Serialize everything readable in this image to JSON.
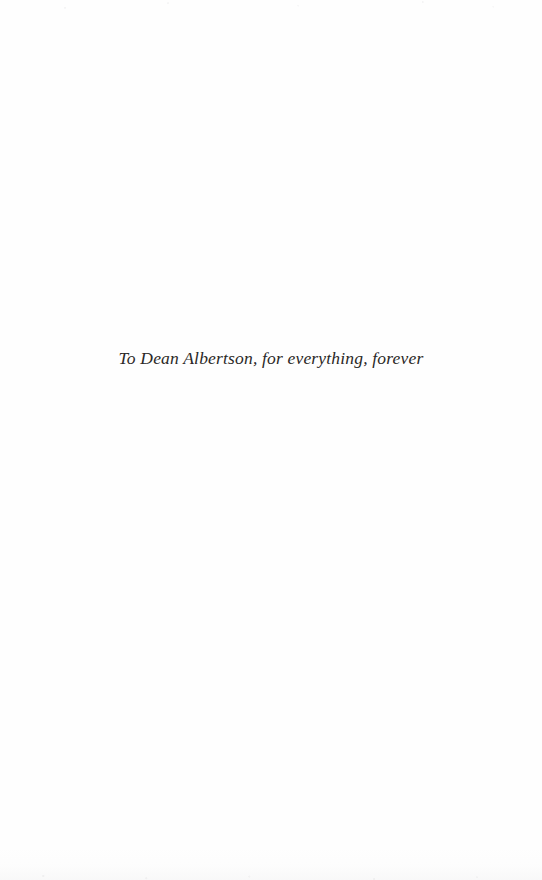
{
  "page": {
    "kind": "book-dedication-page",
    "background_color": "#fefefe",
    "ink_color": "#2a2826"
  },
  "dedication": {
    "text": "To Dean Albertson, for everything, forever"
  }
}
